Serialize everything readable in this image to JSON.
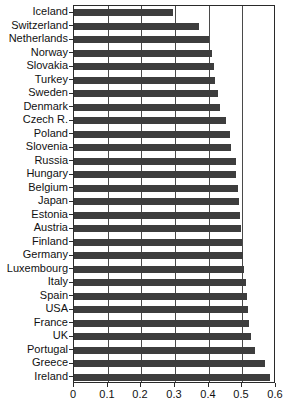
{
  "chart_data": {
    "type": "bar",
    "orientation": "horizontal",
    "title": "",
    "xlabel": "",
    "ylabel": "",
    "xlim": [
      0,
      0.6
    ],
    "xticks": [
      0,
      0.1,
      0.2,
      0.3,
      0.4,
      0.5,
      0.6
    ],
    "xtick_labels": [
      "0",
      "0.1",
      "0.2",
      "0.3",
      "0.4",
      "0.5",
      "0.6"
    ],
    "grid": "vertical-at-ticks",
    "legend": "none",
    "bar_color": "#3d3d3d",
    "frame_color": "#2a2a2a",
    "categories": [
      "Iceland",
      "Switzerland",
      "Netherlands",
      "Norway",
      "Slovakia",
      "Turkey",
      "Sweden",
      "Denmark",
      "Czech R.",
      "Poland",
      "Slovenia",
      "Russia",
      "Hungary",
      "Belgium",
      "Japan",
      "Estonia",
      "Austria",
      "Finland",
      "Germany",
      "Luxembourg",
      "Italy",
      "Spain",
      "USA",
      "France",
      "UK",
      "Portugal",
      "Greece",
      "Ireland"
    ],
    "values": [
      0.295,
      0.37,
      0.4,
      0.41,
      0.415,
      0.42,
      0.428,
      0.435,
      0.452,
      0.462,
      0.465,
      0.48,
      0.482,
      0.487,
      0.49,
      0.492,
      0.497,
      0.5,
      0.503,
      0.506,
      0.511,
      0.514,
      0.517,
      0.521,
      0.527,
      0.537,
      0.568,
      0.583
    ]
  }
}
